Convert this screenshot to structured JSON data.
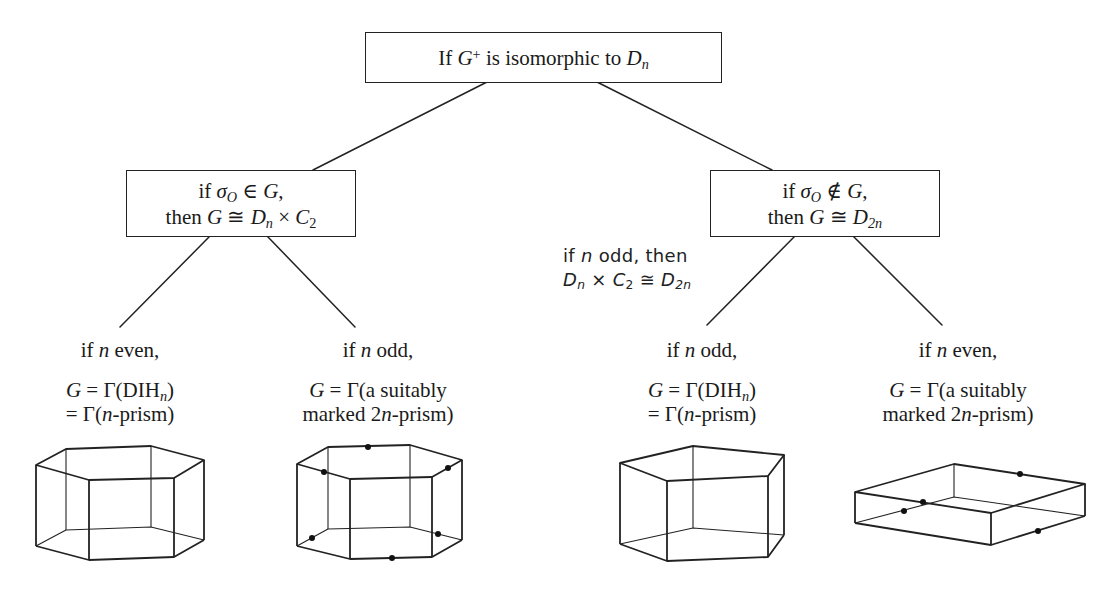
{
  "root": {
    "text": "If G⁺ is isomorphic to Dₙ",
    "parts": {
      "pre": "If ",
      "G": "G",
      "sup": "+",
      "mid": " is isomorphic to ",
      "D": "D",
      "sub": "n"
    }
  },
  "left_branch": {
    "line1": {
      "pre": "if ",
      "sigma": "σ",
      "sub": "O",
      "rel": " ∈ ",
      "G": "G",
      "post": ","
    },
    "line2": {
      "pre": "then ",
      "G": "G",
      "rel": " ≅ ",
      "D": "D",
      "dsub": "n",
      "times": " × ",
      "C": "C",
      "csub": "2"
    },
    "text": "if σ_O ∈ G, then G ≅ Dₙ × C₂"
  },
  "right_branch": {
    "line1": {
      "pre": "if ",
      "sigma": "σ",
      "sub": "O",
      "rel": " ∉ ",
      "G": "G",
      "post": ","
    },
    "line2": {
      "pre": "then ",
      "G": "G",
      "rel": " ≅ ",
      "D": "D",
      "dsub": "2n"
    },
    "text": "if σ_O ∉ G, then G ≅ D₂ₙ"
  },
  "annotation": {
    "line1": "if n odd, then",
    "line1_parts": {
      "pre": "if ",
      "n": "n",
      "post": " odd, then"
    },
    "line2_parts": {
      "D": "D",
      "dsub": "n",
      "times": " × ",
      "C": "C",
      "csub": "2",
      "rel": " ≅ ",
      "D2": "D",
      "d2sub": "2n"
    }
  },
  "leaves": [
    {
      "cond": {
        "pre": "if ",
        "n": "n",
        "post": " even,"
      },
      "l1": {
        "G": "G",
        "eq": " = Γ(DIH",
        "sub": "n",
        "close": ")"
      },
      "l2": {
        "pre": "= Γ(",
        "n": "n",
        "post": "-prism)"
      },
      "shape": "hexagonal-prism",
      "marked": false
    },
    {
      "cond": {
        "pre": "if ",
        "n": "n",
        "post": " odd,"
      },
      "l1": {
        "G": "G",
        "eq": " = Γ(a suitably"
      },
      "l2": {
        "pre": "marked 2",
        "n": "n",
        "post": "-prism)"
      },
      "shape": "marked-hexagonal-prism",
      "marked": true
    },
    {
      "cond": {
        "pre": "if ",
        "n": "n",
        "post": " odd,"
      },
      "l1": {
        "G": "G",
        "eq": " = Γ(DIH",
        "sub": "n",
        "close": ")"
      },
      "l2": {
        "pre": "= Γ(",
        "n": "n",
        "post": "-prism)"
      },
      "shape": "pentagonal-prism",
      "marked": false
    },
    {
      "cond": {
        "pre": "if ",
        "n": "n",
        "post": " even,"
      },
      "l1": {
        "G": "G",
        "eq": " = Γ(a suitably"
      },
      "l2": {
        "pre": "marked 2",
        "n": "n",
        "post": "-prism)"
      },
      "shape": "marked-square-prism",
      "marked": true
    }
  ],
  "colors": {
    "line": "#222222",
    "background": "#ffffff",
    "text": "#1a1a1a"
  }
}
